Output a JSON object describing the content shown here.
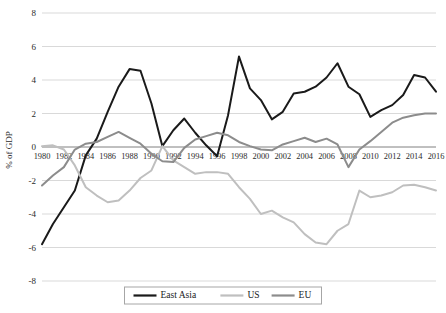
{
  "chart_data": {
    "type": "line",
    "title": "",
    "subtitle": "",
    "xlabel": "",
    "ylabel": "% of GDP",
    "ylim": [
      -8,
      8
    ],
    "xlim": [
      1980,
      2016
    ],
    "yticks": [
      8,
      6,
      4,
      2,
      0,
      -2,
      -4,
      -6,
      -8
    ],
    "ytick_labels": [
      "8",
      "6",
      "4",
      "2",
      "0",
      "-2",
      "-4",
      "-6",
      "-8"
    ],
    "grid": true,
    "legend_position": "bottom",
    "x": [
      1980,
      1981,
      1982,
      1983,
      1984,
      1985,
      1986,
      1987,
      1988,
      1989,
      1990,
      1991,
      1992,
      1993,
      1994,
      1995,
      1996,
      1997,
      1998,
      1999,
      2000,
      2001,
      2002,
      2003,
      2004,
      2005,
      2006,
      2007,
      2008,
      2009,
      2010,
      2011,
      2012,
      2013,
      2014,
      2015,
      2016
    ],
    "xtick_labels": [
      "1980",
      "1982",
      "1984",
      "1986",
      "1988",
      "1990",
      "1992",
      "1994",
      "1996",
      "1998",
      "2000",
      "2002",
      "2004",
      "2006",
      "2008",
      "2010",
      "2012",
      "2014",
      "2016"
    ],
    "xticks": [
      1980,
      1982,
      1984,
      1986,
      1988,
      1990,
      1992,
      1994,
      1996,
      1998,
      2000,
      2002,
      2004,
      2006,
      2008,
      2010,
      2012,
      2014,
      2016
    ],
    "series": [
      {
        "name": "East Asia",
        "color": "#1a1a1a",
        "width": 2.0,
        "values": [
          -5.8,
          -4.6,
          -3.6,
          -2.6,
          -0.5,
          0.5,
          2.1,
          3.6,
          4.65,
          4.55,
          2.6,
          0.05,
          1.0,
          1.7,
          0.85,
          0.1,
          -0.55,
          1.9,
          5.4,
          3.5,
          2.8,
          1.65,
          2.1,
          3.2,
          3.3,
          3.6,
          4.15,
          5.0,
          3.6,
          3.15,
          1.8,
          2.2,
          2.5,
          3.1,
          4.3,
          4.15,
          3.3
        ]
      },
      {
        "name": "US",
        "color": "#bfbfbf",
        "width": 2.0,
        "values": [
          0.05,
          0.1,
          -0.15,
          -1.1,
          -2.4,
          -2.9,
          -3.3,
          -3.2,
          -2.6,
          -1.85,
          -1.4,
          0.05,
          -0.8,
          -1.2,
          -1.6,
          -1.5,
          -1.5,
          -1.6,
          -2.4,
          -3.1,
          -4.0,
          -3.8,
          -4.2,
          -4.5,
          -5.2,
          -5.7,
          -5.8,
          -5.0,
          -4.6,
          -2.6,
          -3.0,
          -2.9,
          -2.7,
          -2.3,
          -2.25,
          -2.4,
          -2.6
        ]
      },
      {
        "name": "EU",
        "color": "#8c8c8c",
        "width": 2.0,
        "values": [
          -2.3,
          -1.7,
          -1.2,
          -0.15,
          0.2,
          0.3,
          0.6,
          0.9,
          0.55,
          0.2,
          -0.4,
          -0.85,
          -0.9,
          -0.05,
          0.45,
          0.65,
          0.85,
          0.7,
          0.3,
          0.05,
          -0.15,
          -0.2,
          0.15,
          0.35,
          0.55,
          0.3,
          0.5,
          0.15,
          -1.2,
          -0.15,
          0.35,
          0.9,
          1.45,
          1.75,
          1.9,
          2.0,
          2.0
        ]
      }
    ]
  },
  "legend": {
    "items": [
      {
        "label": "East Asia",
        "color": "#1a1a1a"
      },
      {
        "label": "US",
        "color": "#bfbfbf"
      },
      {
        "label": "EU",
        "color": "#8c8c8c"
      }
    ]
  }
}
